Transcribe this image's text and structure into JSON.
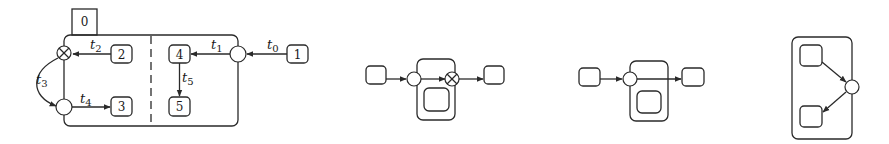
{
  "figure": {
    "colors": {
      "stroke": "#2a2a2a",
      "background": "#ffffff"
    }
  },
  "diagram1": {
    "states": {
      "s0": "0",
      "s1": "1",
      "s2": "2",
      "s3": "3",
      "s4": "4",
      "s5": "5"
    },
    "transitions": {
      "t0": {
        "base": "t",
        "sub": "0"
      },
      "t1": {
        "base": "t",
        "sub": "1"
      },
      "t2": {
        "base": "t",
        "sub": "2"
      },
      "t3": {
        "base": "t",
        "sub": "3"
      },
      "t4": {
        "base": "t",
        "sub": "4"
      },
      "t5": {
        "base": "t",
        "sub": "5"
      }
    },
    "junctions": [
      "fork-circle",
      "xor-circle",
      "join-circle"
    ]
  },
  "diagram2": {
    "junctions": [
      "fork-circle",
      "xor-circle"
    ]
  },
  "diagram3": {
    "junctions": [
      "fork-circle"
    ]
  },
  "diagram4": {
    "junctions": [
      "junction-circle"
    ]
  }
}
